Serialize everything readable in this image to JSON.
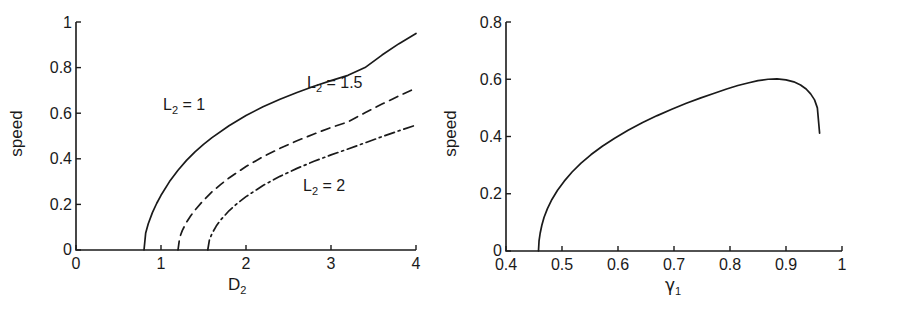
{
  "figure": {
    "background": "#ffffff",
    "ink_color": "#1a1a1a"
  },
  "chart_data": [
    {
      "type": "line",
      "panel": "left",
      "title": "",
      "xlabel": "D_2",
      "xlabel_base": "D",
      "xlabel_sub": "2",
      "ylabel": "speed",
      "xlim": [
        0,
        4
      ],
      "ylim": [
        0,
        1
      ],
      "xticks": [
        0,
        1,
        2,
        3,
        4
      ],
      "xticklabels": [
        "0",
        "1",
        "2",
        "3",
        "4"
      ],
      "yticks": [
        0,
        0.2,
        0.4,
        0.6,
        0.8,
        1
      ],
      "yticklabels": [
        "0",
        "0.2",
        "0.4",
        "0.6",
        "0.8",
        "1"
      ],
      "grid": false,
      "legend": "inline-annotations",
      "series": [
        {
          "name": "L_2 = 1",
          "label_base": "L",
          "label_sub": "2",
          "label_rest": " = 1",
          "linestyle": "solid",
          "color": "#1a1a1a",
          "x": [
            0.8,
            0.82,
            0.85,
            0.9,
            0.95,
            1.0,
            1.1,
            1.2,
            1.3,
            1.4,
            1.5,
            1.6,
            1.8,
            2.0,
            2.2,
            2.4,
            2.6,
            2.8,
            3.0,
            3.2,
            3.4,
            3.6,
            3.8,
            4.0
          ],
          "y": [
            0.0,
            0.075,
            0.115,
            0.165,
            0.205,
            0.24,
            0.3,
            0.35,
            0.393,
            0.43,
            0.463,
            0.493,
            0.545,
            0.59,
            0.628,
            0.661,
            0.691,
            0.718,
            0.743,
            0.766,
            0.8,
            0.855,
            0.905,
            0.95
          ]
        },
        {
          "name": "L_2 = 1.5",
          "label_base": "L",
          "label_sub": "2",
          "label_rest": " = 1.5",
          "linestyle": "dashed",
          "color": "#1a1a1a",
          "x": [
            1.2,
            1.22,
            1.25,
            1.3,
            1.35,
            1.4,
            1.5,
            1.6,
            1.7,
            1.8,
            2.0,
            2.2,
            2.4,
            2.6,
            2.8,
            3.0,
            3.2,
            3.4,
            3.6,
            3.8,
            4.0
          ],
          "y": [
            0.0,
            0.055,
            0.085,
            0.122,
            0.15,
            0.175,
            0.218,
            0.255,
            0.287,
            0.316,
            0.366,
            0.409,
            0.446,
            0.479,
            0.509,
            0.537,
            0.562,
            0.602,
            0.64,
            0.676,
            0.71
          ]
        },
        {
          "name": "L_2 = 2",
          "label_base": "L",
          "label_sub": "2",
          "label_rest": " = 2",
          "linestyle": "dashdot",
          "color": "#1a1a1a",
          "x": [
            1.55,
            1.57,
            1.6,
            1.65,
            1.7,
            1.8,
            1.9,
            2.0,
            2.2,
            2.4,
            2.6,
            2.8,
            3.0,
            3.2,
            3.4,
            3.6,
            3.8,
            4.0
          ],
          "y": [
            0.0,
            0.045,
            0.072,
            0.105,
            0.131,
            0.172,
            0.205,
            0.234,
            0.283,
            0.323,
            0.358,
            0.389,
            0.417,
            0.443,
            0.47,
            0.497,
            0.523,
            0.548
          ]
        }
      ],
      "annotations": [
        {
          "text": "L_2 = 1",
          "x": 1.32,
          "y": 0.655
        },
        {
          "text": "L_2 = 1.5",
          "x": 3.02,
          "y": 0.755
        },
        {
          "text": "L_2 = 2",
          "x": 2.98,
          "y": 0.3
        }
      ]
    },
    {
      "type": "line",
      "panel": "right",
      "title": "",
      "xlabel": "gamma_1",
      "xlabel_base": "γ",
      "xlabel_sub": "1",
      "ylabel": "speed",
      "xlim": [
        0.4,
        1.0
      ],
      "ylim": [
        0,
        0.8
      ],
      "xticks": [
        0.4,
        0.5,
        0.6,
        0.7,
        0.8,
        0.9,
        1.0
      ],
      "xticklabels": [
        "0.4",
        "0.5",
        "0.6",
        "0.7",
        "0.8",
        "0.9",
        "1"
      ],
      "yticks": [
        0,
        0.2,
        0.4,
        0.6,
        0.8
      ],
      "yticklabels": [
        "0",
        "0.2",
        "0.4",
        "0.6",
        "0.8"
      ],
      "grid": false,
      "legend": "none",
      "series": [
        {
          "name": "speed curve",
          "linestyle": "solid",
          "color": "#1a1a1a",
          "x": [
            0.458,
            0.459,
            0.461,
            0.464,
            0.468,
            0.474,
            0.482,
            0.492,
            0.504,
            0.518,
            0.534,
            0.552,
            0.572,
            0.594,
            0.618,
            0.644,
            0.67,
            0.696,
            0.722,
            0.748,
            0.772,
            0.794,
            0.814,
            0.832,
            0.85,
            0.868,
            0.884,
            0.9,
            0.914,
            0.926,
            0.936,
            0.944,
            0.951,
            0.956,
            0.96
          ],
          "y": [
            0.0,
            0.035,
            0.062,
            0.09,
            0.118,
            0.148,
            0.18,
            0.212,
            0.244,
            0.276,
            0.307,
            0.337,
            0.366,
            0.394,
            0.422,
            0.449,
            0.473,
            0.495,
            0.516,
            0.535,
            0.551,
            0.566,
            0.578,
            0.587,
            0.595,
            0.6,
            0.601,
            0.598,
            0.591,
            0.58,
            0.566,
            0.549,
            0.528,
            0.5,
            0.412
          ]
        }
      ],
      "annotations": []
    }
  ]
}
